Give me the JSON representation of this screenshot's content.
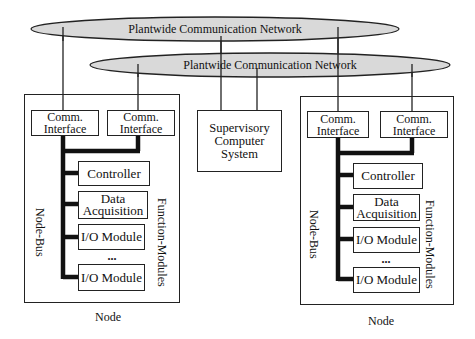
{
  "networks": [
    {
      "id": "net-1",
      "label": "Plantwide Communication Network"
    },
    {
      "id": "net-2",
      "label": "Plantwide Communication Network"
    }
  ],
  "supervisory": {
    "label": "Supervisory Computer System",
    "lines": [
      "Supervisory",
      "Computer",
      "System"
    ]
  },
  "nodes": [
    {
      "label": "Node",
      "bus_label": "Node-Bus",
      "modules_label": "Function-Modules",
      "comm_interfaces": [
        {
          "lines": [
            "Comm.",
            "Interface"
          ]
        },
        {
          "lines": [
            "Comm.",
            "Interface"
          ]
        }
      ],
      "modules": [
        {
          "lines": [
            "Controller"
          ]
        },
        {
          "lines": [
            "Data",
            "Acquisition"
          ]
        },
        {
          "lines": [
            "I/O Module"
          ]
        },
        {
          "lines": [
            "I/O Module"
          ]
        }
      ],
      "ellipsis": "..."
    },
    {
      "label": "Node",
      "bus_label": "Node-Bus",
      "modules_label": "Function-Modules",
      "comm_interfaces": [
        {
          "lines": [
            "Comm.",
            "Interface"
          ]
        },
        {
          "lines": [
            "Comm.",
            "Interface"
          ]
        }
      ],
      "modules": [
        {
          "lines": [
            "Controller"
          ]
        },
        {
          "lines": [
            "Data",
            "Acquisition"
          ]
        },
        {
          "lines": [
            "I/O Module"
          ]
        },
        {
          "lines": [
            "I/O Module"
          ]
        }
      ],
      "ellipsis": "..."
    }
  ],
  "colors": {
    "network_fill": "#d9d9d9",
    "stroke": "#222222",
    "bus": "#111111"
  }
}
